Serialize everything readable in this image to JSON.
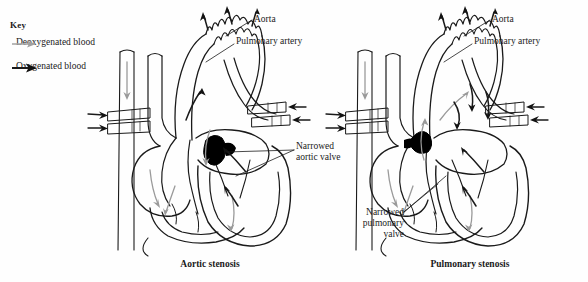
{
  "figure": {
    "type": "anatomical-diagram",
    "panels": [
      {
        "caption": "Aortic stenosis",
        "narrowing_label": "Narrowed\naortic valve",
        "labels": [
          "Aorta",
          "Pulmonary artery"
        ]
      },
      {
        "caption": "Pulmonary stenosis",
        "narrowing_label": "Narrowed\npulmonary\nvalve",
        "labels": [
          "Aorta",
          "Pulmonary artery"
        ]
      }
    ]
  },
  "key": {
    "title": "Key",
    "items": [
      {
        "label": "Deoxygenated\nblood",
        "icon": "arrow-right-gray",
        "color": "#9a9a9a"
      },
      {
        "label": "Oxygenated\nblood",
        "icon": "arrow-right-black",
        "color": "#1a1a1a"
      }
    ]
  },
  "left_panel": {
    "caption": "Aortic stenosis",
    "aorta_label": "Aorta",
    "pulmonary_artery_label": "Pulmonary artery",
    "narrowed_valve_label": "Narrowed\naortic valve"
  },
  "right_panel": {
    "caption": "Pulmonary stenosis",
    "aorta_label": "Aorta",
    "pulmonary_artery_label": "Pulmonary artery",
    "narrowed_valve_label": "Narrowed\npulmonary\nvalve"
  },
  "colors": {
    "outline": "#1a1a1a",
    "deoxygenated": "#9a9a9a",
    "oxygenated": "#1a1a1a",
    "stenosis_fill": "#000000",
    "background": "#fefefe"
  }
}
